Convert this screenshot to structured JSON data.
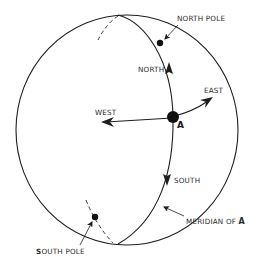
{
  "figure": {
    "type": "globe-directions-diagram",
    "labels": {
      "north_pole": "NORTH POLE",
      "south_pole_first_letter": "S",
      "south_pole_rest": "OUTH POLE",
      "north": "NORTH",
      "south": "SOUTH",
      "east": "EAST",
      "west": "WEST",
      "point": "A",
      "meridian_prefix": "MERIDIAN OF ",
      "meridian_point": "A"
    },
    "colors": {
      "ink": "#1e1e1e",
      "background": "#ffffff"
    }
  }
}
